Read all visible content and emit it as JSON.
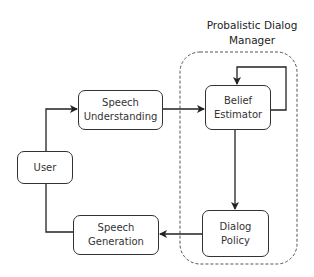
{
  "diagram": {
    "type": "flowchart",
    "container": {
      "title_line1": "Probalistic Dialog",
      "title_line2": "Manager",
      "style": "dashed-rounded"
    },
    "nodes": [
      {
        "id": "user",
        "line1": "User",
        "line2": ""
      },
      {
        "id": "speech_understanding",
        "line1": "Speech",
        "line2": "Understanding"
      },
      {
        "id": "belief_estimator",
        "line1": "Belief",
        "line2": "Estimator"
      },
      {
        "id": "dialog_policy",
        "line1": "Dialog",
        "line2": "Policy"
      },
      {
        "id": "speech_generation",
        "line1": "Speech",
        "line2": "Generation"
      }
    ],
    "edges": [
      {
        "from": "User",
        "to": "Speech Understanding"
      },
      {
        "from": "Speech Understanding",
        "to": "Belief Estimator"
      },
      {
        "from": "Belief Estimator",
        "to": "Belief Estimator",
        "note": "self-loop"
      },
      {
        "from": "Belief Estimator",
        "to": "Dialog Policy"
      },
      {
        "from": "Dialog Policy",
        "to": "Speech Generation"
      },
      {
        "from": "Speech Generation",
        "to": "User"
      }
    ],
    "colors": {
      "stroke": "#333333",
      "background": "#ffffff",
      "dashed": "#555555"
    }
  }
}
